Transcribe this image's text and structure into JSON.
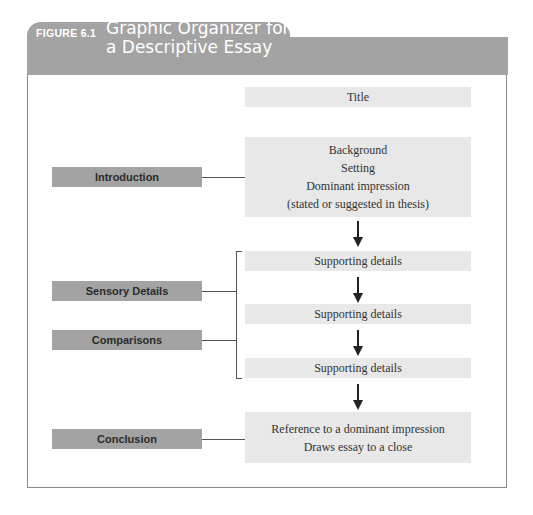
{
  "header": {
    "figure_label": "FIGURE 6.1",
    "title_line1": "Graphic Organizer for",
    "title_line2": "a Descriptive Essay",
    "color": "#a3a3a3"
  },
  "left_labels": {
    "introduction": "Introduction",
    "sensory_details": "Sensory Details",
    "comparisons": "Comparisons",
    "conclusion": "Conclusion"
  },
  "right_boxes": {
    "title": "Title",
    "intro_lines": [
      "Background",
      "Setting",
      "Dominant impression",
      "(stated or suggested in thesis)"
    ],
    "supporting": [
      "Supporting details",
      "Supporting details",
      "Supporting details"
    ],
    "conclusion_lines": [
      "Reference to a dominant impression",
      "Draws essay to a close"
    ]
  },
  "colors": {
    "label_box": "#a3a3a3",
    "content_box": "#e8e8e8",
    "border": "#8a8a8a"
  }
}
